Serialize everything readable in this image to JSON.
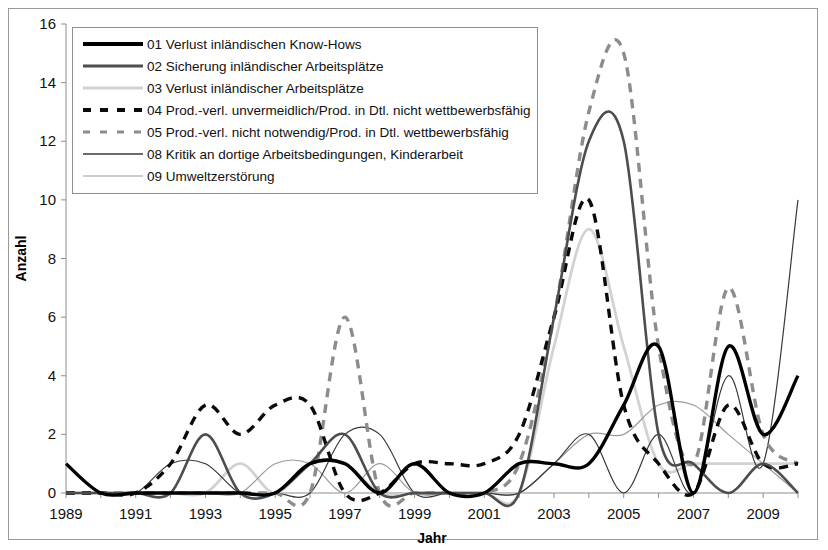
{
  "axes": {
    "y_title": "Anzahl",
    "x_title": "Jahr",
    "y_ticks": [
      "0",
      "2",
      "4",
      "6",
      "8",
      "10",
      "12",
      "14",
      "16"
    ],
    "x_ticks": [
      "1989",
      "1991",
      "1993",
      "1995",
      "1997",
      "1999",
      "2001",
      "2003",
      "2005",
      "2007",
      "2009"
    ]
  },
  "legend": {
    "items": [
      {
        "key": "01",
        "label": "01 Verlust inländischen Know-Hows",
        "style": "solid-thick-black",
        "color": "#000000"
      },
      {
        "key": "02",
        "label": "02 Sicherung inländischer Arbeitsplätze",
        "style": "solid-medium-darkgray",
        "color": "#4d4d4d"
      },
      {
        "key": "03",
        "label": "03 Verlust inländischer Arbeitsplätze",
        "style": "solid-medium-lightgray",
        "color": "#d2d2d2"
      },
      {
        "key": "04",
        "label": "04 Prod.-verl. unvermeidlich/Prod. in Dtl. nicht wettbewerbsfähig",
        "style": "dashed-thick-black",
        "color": "#0a0a0a"
      },
      {
        "key": "05",
        "label": "05 Prod.-verl. nicht notwendig/Prod. in Dtl. wettbewerbsfähig",
        "style": "dashed-thick-gray",
        "color": "#8c8c8c"
      },
      {
        "key": "08",
        "label": "08 Kritik an dortige Arbeitsbedingungen, Kinderarbeit",
        "style": "solid-thin-darkgray",
        "color": "#3a3a3a"
      },
      {
        "key": "09",
        "label": "09 Umweltzerstörung",
        "style": "solid-thin-gray",
        "color": "#9b9b9b"
      }
    ]
  },
  "chart_data": {
    "type": "line",
    "title": "",
    "xlabel": "Jahr",
    "ylabel": "Anzahl",
    "xlim": [
      1989,
      2010
    ],
    "ylim": [
      0,
      16
    ],
    "grid": false,
    "legend_position": "top-left-inside",
    "smoothing": "spline",
    "x": [
      1989,
      1990,
      1991,
      1992,
      1993,
      1994,
      1995,
      1996,
      1997,
      1998,
      1999,
      2000,
      2001,
      2002,
      2003,
      2004,
      2005,
      2006,
      2007,
      2008,
      2009,
      2010
    ],
    "series": [
      {
        "name": "01 Verlust inländischen Know-Hows",
        "key": "01",
        "color": "#000000",
        "style": "solid-thick-black",
        "values": [
          1,
          0,
          0,
          0,
          0,
          0,
          0,
          1,
          1,
          0,
          1,
          0,
          0,
          1,
          1,
          1,
          3,
          5,
          0,
          5,
          2,
          4
        ]
      },
      {
        "name": "02 Sicherung inländischer Arbeitsplätze",
        "key": "02",
        "color": "#4d4d4d",
        "style": "solid-medium-darkgray",
        "values": [
          0,
          0,
          0,
          0,
          2,
          0,
          0,
          1,
          2,
          0,
          0,
          0,
          0,
          0,
          6,
          12,
          12,
          2,
          1,
          0,
          1,
          0
        ]
      },
      {
        "name": "03 Verlust inländischer Arbeitsplätze",
        "key": "03",
        "color": "#d2d2d2",
        "style": "solid-medium-lightgray",
        "values": [
          0,
          0,
          0,
          0,
          0,
          1,
          0,
          1,
          1,
          0,
          0,
          0,
          0,
          0,
          5,
          9,
          5,
          1,
          1,
          1,
          1,
          1
        ]
      },
      {
        "name": "04 Prod.-verl. unvermeidlich/Prod. in Dtl. nicht wettbewerbsfähig",
        "key": "04",
        "color": "#0a0a0a",
        "style": "dashed-thick-black",
        "values": [
          0,
          0,
          0,
          1,
          3,
          2,
          3,
          3,
          0,
          0,
          1,
          1,
          1,
          2,
          6,
          10,
          3,
          1,
          0,
          3,
          1,
          1
        ]
      },
      {
        "name": "05 Prod.-verl. nicht notwendig/Prod. in Dtl. wettbewerbsfähig",
        "key": "05",
        "color": "#8c8c8c",
        "style": "dashed-thick-gray",
        "values": [
          0,
          0,
          0,
          0,
          0,
          0,
          0,
          0,
          6,
          0,
          0,
          0,
          0,
          1,
          6,
          13,
          15,
          5,
          1,
          7,
          2,
          1
        ]
      },
      {
        "name": "08 Kritik an dortige Arbeitsbedingungen, Kinderarbeit",
        "key": "08",
        "color": "#3a3a3a",
        "style": "solid-thin-darkgray",
        "values": [
          0,
          0,
          0,
          1,
          1,
          0,
          0,
          0,
          2,
          2,
          0,
          0,
          0,
          0,
          1,
          2,
          0,
          2,
          0,
          4,
          1,
          10
        ]
      },
      {
        "name": "09 Umweltzerstörung",
        "key": "09",
        "color": "#9b9b9b",
        "style": "solid-thin-gray",
        "values": [
          0,
          0,
          0,
          0,
          0,
          0,
          1,
          1,
          0,
          1,
          0,
          0,
          0,
          0,
          1,
          2,
          2,
          3,
          3,
          2,
          1,
          0
        ]
      }
    ]
  }
}
